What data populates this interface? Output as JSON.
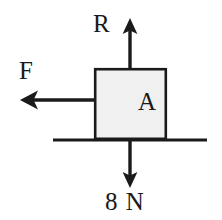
{
  "figure": {
    "background_color": "#ffffff",
    "stroke_color": "#1a1a1a",
    "block": {
      "label": "A",
      "fill_color": "#f0f0f0",
      "border_color": "#1a1a1a",
      "x": 94,
      "y": 68,
      "width": 73,
      "height": 71
    },
    "ground": {
      "label": "",
      "x1": 53,
      "y1": 140,
      "x2": 207,
      "y2": 140
    },
    "forces": [
      {
        "name": "normal-reaction",
        "label": "R",
        "direction": "up",
        "magnitude_text": "",
        "tail_x": 130,
        "tail_y": 68,
        "tip_x": 130,
        "tip_y": 20
      },
      {
        "name": "applied-friction",
        "label": "F",
        "direction": "left",
        "magnitude_text": "",
        "tail_x": 94,
        "tail_y": 100,
        "tip_x": 21,
        "tip_y": 100
      },
      {
        "name": "weight",
        "label": "8 N",
        "direction": "down",
        "magnitude_text": "8 N",
        "tail_x": 130,
        "tail_y": 139,
        "tip_x": 130,
        "tip_y": 187
      }
    ]
  }
}
